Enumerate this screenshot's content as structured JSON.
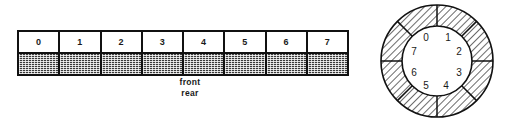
{
  "figure": {
    "linear_queue": {
      "name": "linear-array-queue",
      "cells": [
        {
          "index": "0"
        },
        {
          "index": "1"
        },
        {
          "index": "2"
        },
        {
          "index": "3"
        },
        {
          "index": "4"
        },
        {
          "index": "5"
        },
        {
          "index": "6"
        },
        {
          "index": "7"
        }
      ],
      "pointers": {
        "front_label": "front",
        "rear_label": "rear"
      }
    },
    "circular_queue": {
      "name": "circular-ring-queue",
      "segment_labels": [
        "0",
        "1",
        "2",
        "3",
        "4",
        "5",
        "6",
        "7"
      ],
      "segment_count": 8
    }
  },
  "colors": {
    "outline": "#111111",
    "slot_fill": "#3a3a3a",
    "hatch_stroke": "#2b2b2b",
    "background": "#ffffff",
    "text": "#1a1a1a"
  }
}
